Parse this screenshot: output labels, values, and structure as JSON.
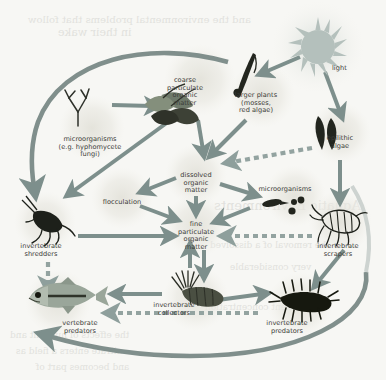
{
  "figure": {
    "background_color": "#f7f7f4",
    "arrow_color": "#7d8f8c",
    "arrow_color_dark": "#6a7d7a",
    "dashed_arrow_color": "#8a9c99",
    "halo_color": "#e7e6e0",
    "text_color": "#3b3b38",
    "sun_color": "#b9c4c0",
    "bleed_text": [
      {
        "text": "and the environmental problems that follow",
        "x": 28,
        "y": 14,
        "size": 10
      },
      {
        "text": "in their wake",
        "x": 58,
        "y": 26,
        "size": 11
      },
      {
        "text": "Aquatic Environments",
        "x": 214,
        "y": 198,
        "size": 13
      },
      {
        "text": "the removal of a dissolved",
        "x": 210,
        "y": 240,
        "size": 9
      },
      {
        "text": "very considerable",
        "x": 230,
        "y": 262,
        "size": 9
      },
      {
        "text": "sediment concentration",
        "x": 205,
        "y": 302,
        "size": 9
      },
      {
        "text": "the effects of nutrient and",
        "x": 10,
        "y": 330,
        "size": 9
      },
      {
        "text": "nitrate enters a field as",
        "x": 16,
        "y": 346,
        "size": 9
      },
      {
        "text": "and becomes part of",
        "x": 36,
        "y": 362,
        "size": 9
      }
    ]
  },
  "nodes": [
    {
      "id": "light",
      "label": "light",
      "x": 332,
      "y": 65,
      "align": "left"
    },
    {
      "id": "coarse-pom",
      "label": "coarse\nparticulate\norganic\nmatter",
      "x": 185,
      "y": 77,
      "align": "center"
    },
    {
      "id": "larger-plants",
      "label": "larger plants\n(mosses,\nred algae)",
      "x": 256,
      "y": 92,
      "align": "center"
    },
    {
      "id": "epilithic-algae",
      "label": "epilithic\nalgae",
      "x": 340,
      "y": 135,
      "align": "center"
    },
    {
      "id": "microorganisms-fungi",
      "label": "microorganisms\n(e.g. hyphomycete\nfungi)",
      "x": 90,
      "y": 136,
      "align": "center"
    },
    {
      "id": "dissolved-om",
      "label": "dissolved\norganic\nmatter",
      "x": 196,
      "y": 172,
      "align": "center"
    },
    {
      "id": "microorganisms",
      "label": "microorganisms",
      "x": 285,
      "y": 186,
      "align": "center"
    },
    {
      "id": "flocculation",
      "label": "flocculation",
      "x": 122,
      "y": 199,
      "align": "center"
    },
    {
      "id": "fine-pom",
      "label": "fine\nparticulate\norganic\nmatter",
      "x": 196,
      "y": 221,
      "align": "center"
    },
    {
      "id": "invertebrate-shredders",
      "label": "invertebrate\nshredders",
      "x": 41,
      "y": 243,
      "align": "center"
    },
    {
      "id": "invertebrate-scrapers",
      "label": "invertebrate\nscrapers",
      "x": 338,
      "y": 243,
      "align": "center"
    },
    {
      "id": "invertebrate-collectors",
      "label": "invertebrate\ncollectors",
      "x": 174,
      "y": 302,
      "align": "center"
    },
    {
      "id": "invertebrate-predators",
      "label": "invertebrate\npredators",
      "x": 287,
      "y": 320,
      "align": "center"
    },
    {
      "id": "vertebrate-predators",
      "label": "vertebrate\npredators",
      "x": 80,
      "y": 320,
      "align": "center"
    }
  ],
  "organisms": [
    {
      "id": "sun",
      "name": "sun-glyph",
      "note": "spiky sun disc, top right"
    },
    {
      "id": "leaves",
      "name": "leaf-cluster-glyph",
      "note": "coarse particulate organic matter — fallen leaves"
    },
    {
      "id": "moss",
      "name": "moss-frond-glyph",
      "note": "larger plants — moss / red algae frond"
    },
    {
      "id": "algae",
      "name": "epilithic-algae-glyph",
      "note": "two dark leaf-shaped algal blades"
    },
    {
      "id": "hypha",
      "name": "hyphomycete-fungus-glyph",
      "note": "branched tetraradiate conidium"
    },
    {
      "id": "microbes",
      "name": "microorganism-dots-glyph",
      "note": "rod and coccus bacteria"
    },
    {
      "id": "shredder",
      "name": "stonefly-nymph-glyph",
      "note": "invertebrate shredder"
    },
    {
      "id": "scraper",
      "name": "mayfly-nymph-glyph",
      "note": "invertebrate scraper"
    },
    {
      "id": "collector",
      "name": "blackfly-larva-glyph",
      "note": "invertebrate collector with head fans"
    },
    {
      "id": "predator",
      "name": "predatory-larva-glyph",
      "note": "invertebrate predator"
    },
    {
      "id": "fish",
      "name": "fish-glyph",
      "note": "vertebrate predator"
    }
  ],
  "edges": [
    {
      "from": "microorganisms-fungi",
      "to": "coarse-pom",
      "style": "solid"
    },
    {
      "from": "coarse-pom",
      "to": "dissolved-om",
      "style": "solid"
    },
    {
      "from": "coarse-pom",
      "to": "invertebrate-shredders",
      "style": "solid"
    },
    {
      "from": "larger-plants",
      "to": "dissolved-om",
      "style": "solid"
    },
    {
      "from": "light",
      "to": "larger-plants",
      "style": "solid"
    },
    {
      "from": "light",
      "to": "epilithic-algae",
      "style": "solid"
    },
    {
      "from": "epilithic-algae",
      "to": "dissolved-om",
      "style": "dashed"
    },
    {
      "from": "epilithic-algae",
      "to": "invertebrate-scrapers",
      "style": "solid"
    },
    {
      "from": "dissolved-om",
      "to": "flocculation",
      "style": "solid"
    },
    {
      "from": "dissolved-om",
      "to": "microorganisms",
      "style": "solid"
    },
    {
      "from": "dissolved-om",
      "to": "fine-pom",
      "style": "solid"
    },
    {
      "from": "microorganisms",
      "to": "fine-pom",
      "style": "solid"
    },
    {
      "from": "flocculation",
      "to": "fine-pom",
      "style": "solid"
    },
    {
      "from": "invertebrate-shredders",
      "to": "fine-pom",
      "style": "solid"
    },
    {
      "from": "invertebrate-scrapers",
      "to": "fine-pom",
      "style": "dashed"
    },
    {
      "from": "invertebrate-collectors",
      "to": "fine-pom",
      "style": "solid"
    },
    {
      "from": "fine-pom",
      "to": "invertebrate-collectors",
      "style": "solid"
    },
    {
      "from": "invertebrate-shredders",
      "to": "vertebrate-predators",
      "style": "dashed"
    },
    {
      "from": "invertebrate-scrapers",
      "to": "invertebrate-predators",
      "style": "solid"
    },
    {
      "from": "invertebrate-collectors",
      "to": "vertebrate-predators",
      "style": "solid"
    },
    {
      "from": "invertebrate-collectors",
      "to": "invertebrate-predators",
      "style": "solid"
    },
    {
      "from": "invertebrate-predators",
      "to": "vertebrate-predators",
      "style": "dashed"
    },
    {
      "from": "vertebrate-predators",
      "to": "invertebrate-shredders",
      "style": "curve-left"
    },
    {
      "from": "invertebrate-predators",
      "to": "vertebrate-predators",
      "style": "curve-bottom"
    }
  ]
}
